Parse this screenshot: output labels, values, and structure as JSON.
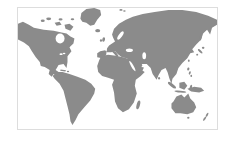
{
  "map": {
    "type": "world",
    "name": "world-map",
    "colors": {
      "land": "#8b8b8b",
      "ocean": "#ffffff",
      "frame_border": "#dddddd",
      "background": "#ffffff"
    },
    "continents_visible": [
      "North America",
      "South America",
      "Europe",
      "Africa",
      "Asia",
      "Australia"
    ],
    "labels": []
  }
}
